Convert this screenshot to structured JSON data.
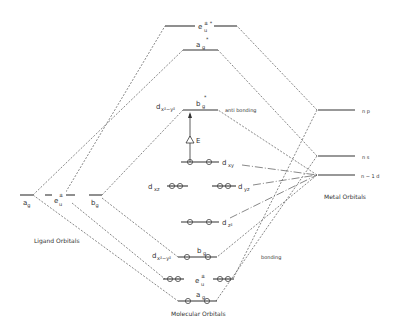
{
  "diagram": {
    "type": "molecular-orbital-diagram",
    "columns": {
      "ligand": "Ligand Orbitals",
      "molecular": "Molecular Orbitals",
      "metal": "Metal Orbitals"
    },
    "ligand_levels": [
      {
        "label": "a",
        "sub": "g",
        "sup": ""
      },
      {
        "label": "e",
        "sub": "u",
        "sup": "±"
      },
      {
        "label": "b",
        "sub": "g",
        "sup": ""
      }
    ],
    "metal_levels": [
      {
        "label": "n p"
      },
      {
        "label": "n s"
      },
      {
        "label": "n − 1  d"
      }
    ],
    "antibonding_levels": [
      {
        "label": "e",
        "sub": "u",
        "sup": "± *"
      },
      {
        "label": "a",
        "sub": "g",
        "sup": "*"
      },
      {
        "label": "b",
        "sub": "g",
        "sup": "*",
        "side_label": "d",
        "side_sub": "x²−y²"
      }
    ],
    "nonbonding_levels": [
      {
        "label": "d",
        "sub": "xy"
      },
      {
        "label": "d",
        "sub": "xz"
      },
      {
        "label": "d",
        "sub": "yz"
      },
      {
        "label": "d",
        "sub": "z²"
      }
    ],
    "bonding_levels": [
      {
        "label": "b",
        "sub": "g",
        "side_label": "d",
        "side_sub": "x²−y²"
      },
      {
        "label": "e",
        "sub": "u",
        "sup": "±"
      },
      {
        "label": "a",
        "sub": "g"
      }
    ],
    "annotations": {
      "antibonding": "anti bonding",
      "bonding": "bonding",
      "delta_e": "E"
    }
  }
}
